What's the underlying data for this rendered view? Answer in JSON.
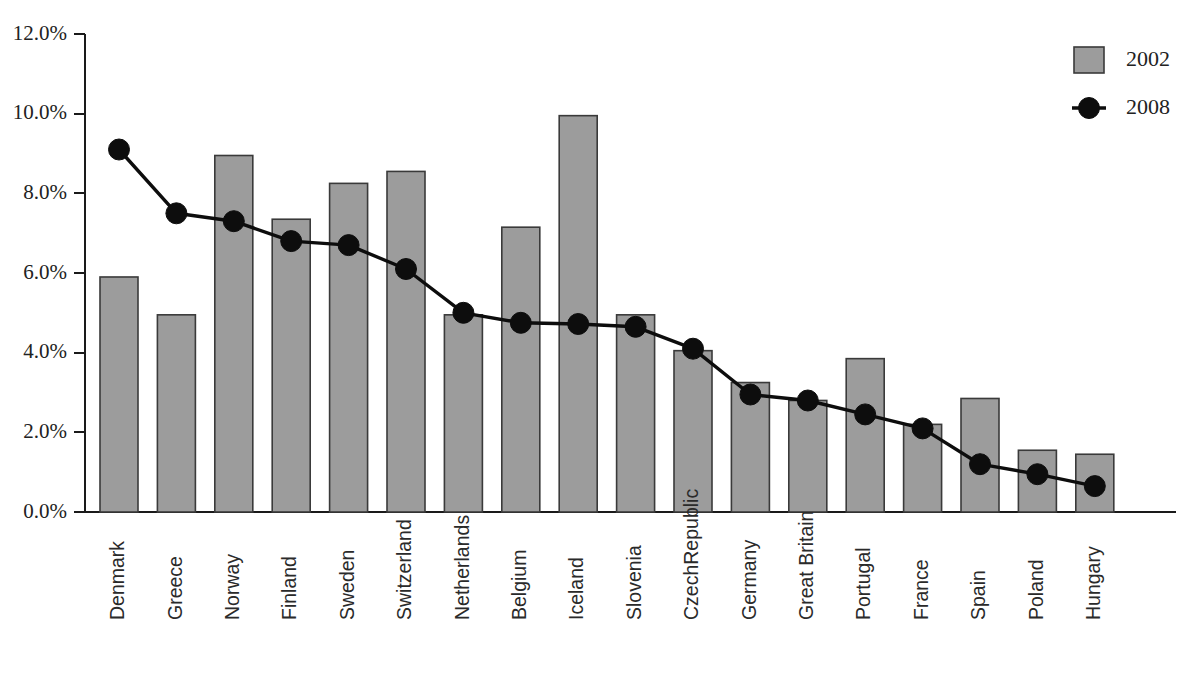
{
  "chart_data": {
    "type": "bar",
    "title": "",
    "subtitle": "",
    "xlabel": "",
    "ylabel": "",
    "ylim": [
      0,
      12
    ],
    "ytick_labels": [
      "0.0%",
      "2.0%",
      "4.0%",
      "6.0%",
      "8.0%",
      "10.0%",
      "12.0%"
    ],
    "ytick_values": [
      0,
      2,
      4,
      6,
      8,
      10,
      12
    ],
    "grid": false,
    "legend_position": "top-right",
    "categories": [
      "Denmark",
      "Greece",
      "Norway",
      "Finland",
      "Sweden",
      "Switzerland",
      "Netherlands",
      "Belgium",
      "Iceland",
      "Slovenia",
      "CzechRepublic",
      "Germany",
      "Great Britain",
      "Portugal",
      "France",
      "Spain",
      "Poland",
      "Hungary"
    ],
    "series": [
      {
        "name": "2002",
        "type": "bar",
        "color": "#9c9c9c",
        "values": [
          5.9,
          4.95,
          8.95,
          7.35,
          8.25,
          8.55,
          4.95,
          7.15,
          9.95,
          4.95,
          4.05,
          3.25,
          2.8,
          3.85,
          2.2,
          2.85,
          1.55,
          1.45
        ]
      },
      {
        "name": "2008",
        "type": "line",
        "color": "#0d0d0d",
        "values": [
          9.1,
          7.5,
          7.3,
          6.8,
          6.7,
          6.1,
          5.0,
          4.75,
          4.72,
          4.65,
          4.1,
          2.95,
          2.8,
          2.45,
          2.1,
          1.2,
          0.95,
          0.65
        ]
      }
    ],
    "legend": [
      {
        "label": "2002",
        "marker": "square-swatch",
        "color": "#9c9c9c"
      },
      {
        "label": "2008",
        "marker": "line-with-dot",
        "color": "#0d0d0d"
      }
    ]
  }
}
